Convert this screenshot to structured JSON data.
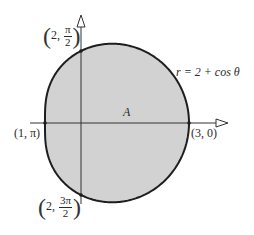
{
  "figure": {
    "curve_equation": "r = 2 + cos θ",
    "region_label": "A",
    "points": [
      {
        "id": "top",
        "coord_r": "2",
        "coord_theta_num": "π",
        "coord_theta_den": "2"
      },
      {
        "id": "left",
        "label": "(1, π)"
      },
      {
        "id": "right",
        "label": "(3, 0)"
      },
      {
        "id": "bottom",
        "coord_r": "2",
        "coord_theta_num": "3π",
        "coord_theta_den": "2"
      }
    ]
  },
  "colors": {
    "fill": "#d2d2d2",
    "stroke": "#1e1e1e",
    "axis": "#333333"
  }
}
